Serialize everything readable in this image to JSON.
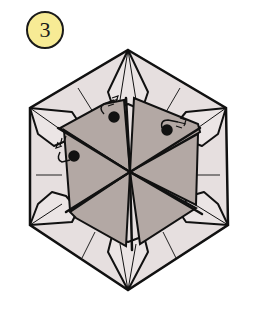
{
  "step": {
    "number": "3"
  },
  "diagram": {
    "outer_shape": "hexagon",
    "inner_shape": "gray hexagon divided into 6 triangles",
    "flap_count": 6,
    "fold_markers": 3,
    "colors": {
      "paper_light": "#e6dfdf",
      "paper_gray": "#b3a8a4",
      "line": "#111111",
      "badge_fill": "#f7eb95"
    }
  }
}
